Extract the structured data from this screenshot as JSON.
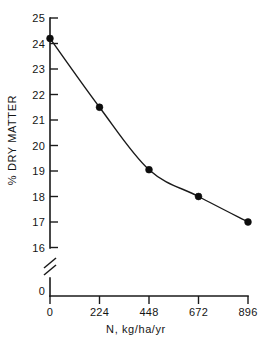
{
  "chart_data": {
    "type": "line",
    "title": "",
    "subtitle": "",
    "xlabel": "N, kg/ha/yr",
    "ylabel": "% DRY MATTER",
    "x": [
      0,
      224,
      448,
      672,
      896
    ],
    "values": [
      24.2,
      21.5,
      19.05,
      18.0,
      17.0
    ],
    "series": [
      {
        "name": "% dry matter",
        "values": [
          24.2,
          21.5,
          19.05,
          18.0,
          17.0
        ]
      }
    ],
    "xticks": [
      0,
      224,
      448,
      672,
      896
    ],
    "xtick_labels": [
      "0",
      "224",
      "448",
      "672",
      "896"
    ],
    "yticks": [
      0,
      16,
      17,
      18,
      19,
      20,
      21,
      22,
      23,
      24,
      25
    ],
    "ytick_labels": [
      "0",
      "16",
      "17",
      "18",
      "19",
      "20",
      "21",
      "22",
      "23",
      "24",
      "25"
    ],
    "xlim": [
      0,
      896
    ],
    "ylim": [
      16,
      25
    ],
    "axis_break": {
      "axis": "y",
      "between": [
        0,
        16
      ],
      "style": "double-slash"
    },
    "grid": false,
    "legend": false,
    "legend_position": "none",
    "marker": "filled-circle",
    "line_style": "solid",
    "annotations": []
  },
  "style": {
    "background": "#ffffff",
    "ink": "#1a1a1a",
    "marker_color": "#0d0d0d"
  },
  "labels": {
    "y_axis_title": "% DRY MATTER",
    "x_axis_title": "N, kg/ha/yr",
    "y_tick_25": "25",
    "y_tick_24": "24",
    "y_tick_23": "23",
    "y_tick_22": "22",
    "y_tick_21": "21",
    "y_tick_20": "20",
    "y_tick_19": "19",
    "y_tick_18": "18",
    "y_tick_17": "17",
    "y_tick_16": "16",
    "y_tick_0": "0",
    "x_tick_0": "0",
    "x_tick_224": "224",
    "x_tick_448": "448",
    "x_tick_672": "672",
    "x_tick_896": "896"
  }
}
